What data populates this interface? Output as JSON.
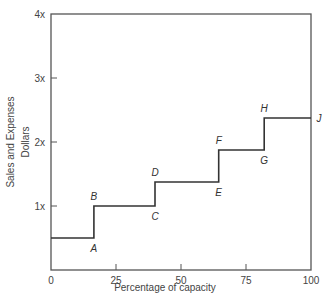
{
  "chart_data": {
    "type": "line",
    "subtype": "step",
    "title": "",
    "xlabel": "Percentage of capacity",
    "ylabel_line1": "Sales and Expenses",
    "ylabel_line2": "Dollars",
    "xlim": [
      0,
      100
    ],
    "ylim": [
      0,
      4
    ],
    "x_ticks": [
      0,
      25,
      50,
      75,
      100
    ],
    "x_tick_labels": [
      "0",
      "25",
      "50",
      "75",
      "100"
    ],
    "y_ticks": [
      1,
      2,
      3,
      4
    ],
    "y_tick_labels": [
      "1x",
      "2x",
      "3x",
      "4x"
    ],
    "grid": false,
    "legend": null,
    "series": [
      {
        "name": "Step expenses",
        "points": [
          {
            "x": 0,
            "y": 0.5
          },
          {
            "x": 16.5,
            "y": 0.5,
            "label": "A"
          },
          {
            "x": 16.5,
            "y": 1.0,
            "label": "B"
          },
          {
            "x": 40,
            "y": 1.0,
            "label": "C"
          },
          {
            "x": 40,
            "y": 1.375,
            "label": "D"
          },
          {
            "x": 64.5,
            "y": 1.375,
            "label": "E"
          },
          {
            "x": 64.5,
            "y": 1.875,
            "label": "F"
          },
          {
            "x": 82,
            "y": 1.875,
            "label": "G"
          },
          {
            "x": 82,
            "y": 2.375,
            "label": "H"
          },
          {
            "x": 100,
            "y": 2.375,
            "label": "J"
          }
        ]
      }
    ],
    "annotations": [
      "A",
      "B",
      "C",
      "D",
      "E",
      "F",
      "G",
      "H",
      "J"
    ]
  },
  "colors": {
    "line": "#333333",
    "axis": "#555555",
    "text": "#444444"
  }
}
